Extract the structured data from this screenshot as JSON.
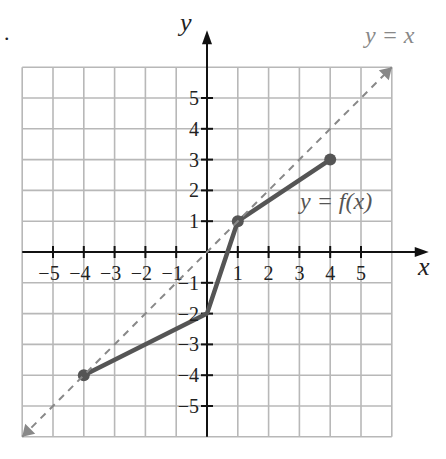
{
  "problem_marker": ".",
  "chart_data": {
    "type": "line",
    "title": "",
    "xlabel": "x",
    "ylabel": "y",
    "xlim": [
      -6,
      6
    ],
    "ylim": [
      -6,
      6
    ],
    "grid": true,
    "x_ticks": [
      -5,
      -4,
      -3,
      -2,
      -1,
      1,
      2,
      3,
      4,
      5
    ],
    "y_ticks": [
      -5,
      -4,
      -3,
      -2,
      -1,
      1,
      2,
      3,
      4,
      5
    ],
    "x_tick_labels": [
      "−5",
      "−4",
      "−3",
      "−2",
      "−1",
      "1",
      "2",
      "3",
      "4",
      "5"
    ],
    "y_tick_labels": [
      "−5",
      "−4",
      "−3",
      "−2",
      "−1",
      "1",
      "2",
      "3",
      "4",
      "5"
    ],
    "series": [
      {
        "name": "y = f(x)",
        "style": "solid",
        "color": "#555555",
        "points": [
          [
            -4,
            -4
          ],
          [
            0,
            -2
          ],
          [
            1,
            1
          ],
          [
            4,
            3
          ]
        ],
        "endpoints_marked": [
          [
            -4,
            -4
          ],
          [
            4,
            3
          ]
        ],
        "vertex_marked": [
          [
            1,
            1
          ]
        ]
      },
      {
        "name": "y = x",
        "style": "dashed",
        "color": "#888888",
        "points": [
          [
            -6,
            -6
          ],
          [
            6,
            6
          ]
        ],
        "arrows": "both"
      }
    ],
    "annotations": [
      {
        "text": "y = x",
        "near": [
          6,
          6.7
        ]
      },
      {
        "text": "y = f(x)",
        "near": [
          4.8,
          1.3
        ]
      }
    ]
  },
  "labels": {
    "x_axis": "x",
    "y_axis": "y",
    "line_identity": "y = x",
    "line_f": "y = f(x)"
  }
}
